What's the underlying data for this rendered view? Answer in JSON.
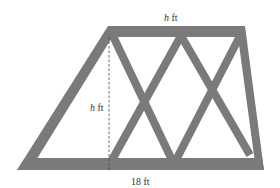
{
  "diagram": {
    "type": "trapezoid truss",
    "labels": {
      "top": {
        "var": "h",
        "unit": "ft"
      },
      "height": {
        "var": "h",
        "unit": "ft"
      },
      "bottom": {
        "text": "18 ft"
      }
    },
    "colors": {
      "truss": "#7a7a7a",
      "background": "#ffffff",
      "dashed": "#444444"
    }
  }
}
